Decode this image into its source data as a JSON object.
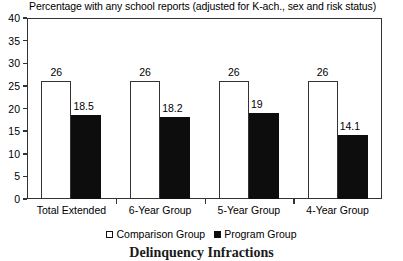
{
  "chart_data": {
    "type": "bar",
    "title": "Percentage with any school reports (adjusted for K-ach., sex and risk status)",
    "caption": "Delinquency Infractions",
    "xlabel": "",
    "ylabel": "",
    "ylim": [
      0,
      40
    ],
    "ytick_step": 5,
    "yticks": [
      40,
      35,
      30,
      25,
      20,
      15,
      10,
      5,
      0
    ],
    "ytick_labels": [
      "40",
      "35",
      "30",
      "25",
      "20",
      "15",
      "10",
      "5",
      "0"
    ],
    "grid": false,
    "legend_position": "bottom",
    "categories": [
      "Total Extended",
      "6-Year Group",
      "5-Year Group",
      "4-Year Group"
    ],
    "series": [
      {
        "name": "Comparison Group",
        "color": "#ffffff",
        "edge_color": "#333333",
        "values": [
          26,
          26,
          26,
          26
        ],
        "labels": [
          "26",
          "26",
          "26",
          "26"
        ]
      },
      {
        "name": "Program Group",
        "color": "#0d0d0d",
        "edge_color": "#0d0d0d",
        "values": [
          18.5,
          18.2,
          19,
          14.1
        ],
        "labels": [
          "18.5",
          "18.2",
          "19",
          "14.1"
        ]
      }
    ]
  },
  "legend": {
    "items": [
      {
        "label": "Comparison Group",
        "swatch": "hollow-square-icon"
      },
      {
        "label": "Program Group",
        "swatch": "filled-square-icon"
      }
    ]
  }
}
